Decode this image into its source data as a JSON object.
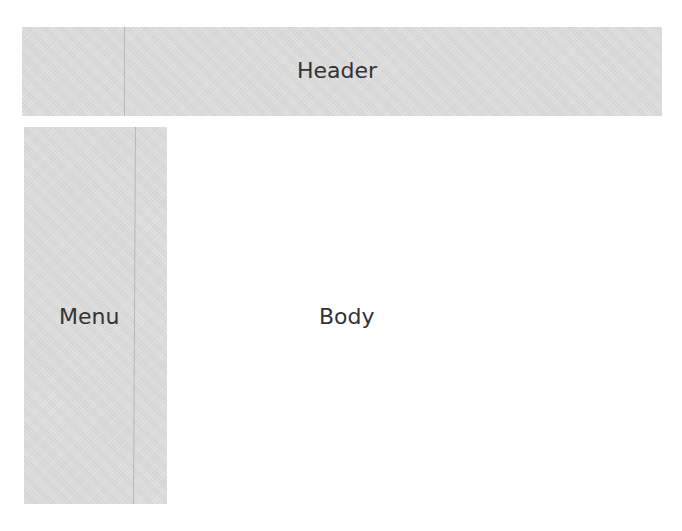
{
  "diagram": {
    "header": {
      "label": "Header",
      "color": "#dedede"
    },
    "menu": {
      "label": "Menu",
      "color": "#dedede"
    },
    "body": {
      "label": "Body",
      "color": "#ffffff"
    }
  }
}
